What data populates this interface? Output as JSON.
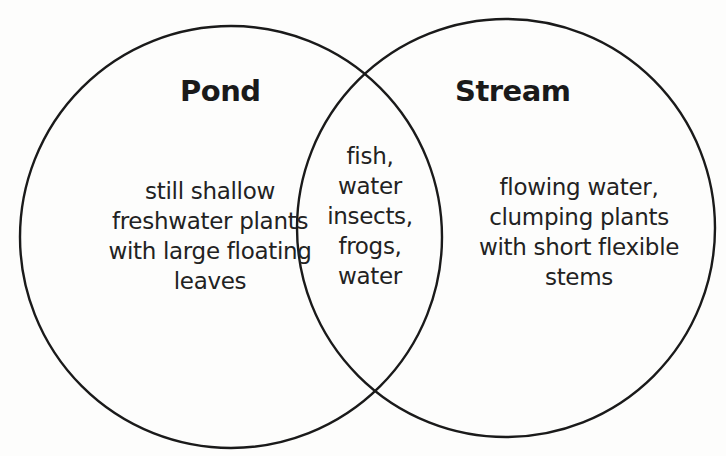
{
  "diagram": {
    "type": "venn",
    "stroke_color": "#1a1a1a",
    "background_color": "#fdfdfc",
    "sets": [
      {
        "id": "pond",
        "title": "Pond",
        "lines": [
          "still shallow",
          "freshwater plants",
          "with large floating",
          "leaves"
        ]
      },
      {
        "id": "stream",
        "title": "Stream",
        "lines": [
          "flowing water,",
          "clumping plants",
          "with short flexible",
          "stems"
        ]
      }
    ],
    "intersection": {
      "lines": [
        "fish,",
        "water",
        "insects,",
        "frogs,",
        "water"
      ]
    }
  }
}
